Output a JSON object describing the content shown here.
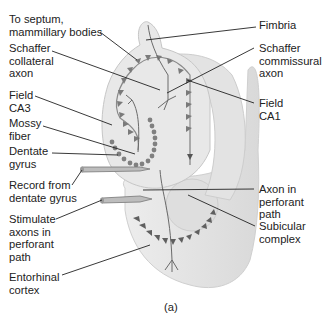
{
  "figure": {
    "caption": "(a)"
  },
  "labels": {
    "left": [
      {
        "id": "septum",
        "text": "To septum,\nmammillary bodies"
      },
      {
        "id": "schaffer_collateral",
        "text": "Schaffer\ncollateral\naxon"
      },
      {
        "id": "field_ca3",
        "text": "Field\nCA3"
      },
      {
        "id": "mossy_fiber",
        "text": "Mossy\nfiber"
      },
      {
        "id": "dentate_gyrus",
        "text": "Dentate\ngyrus"
      },
      {
        "id": "record",
        "text": "Record from\ndentate gyrus"
      },
      {
        "id": "stimulate",
        "text": "Stimulate\naxons in\nperforant\npath"
      },
      {
        "id": "entorhinal",
        "text": "Entorhinal\ncortex"
      }
    ],
    "right": [
      {
        "id": "fimbria",
        "text": "Fimbria"
      },
      {
        "id": "schaffer_commissural",
        "text": "Schaffer\ncommissural\naxon"
      },
      {
        "id": "field_ca1",
        "text": "Field\nCA1"
      },
      {
        "id": "perforant_axon",
        "text": "Axon in\nperforant\npath"
      },
      {
        "id": "subicular",
        "text": "Subicular\ncomplex"
      }
    ]
  },
  "colors": {
    "tissue_fill": "#e6e6e6",
    "tissue_edge": "#c4c4c4",
    "cell_dark": "#6d6d6d",
    "leader_line": "#222222",
    "electrode": "#b5b5b5"
  }
}
